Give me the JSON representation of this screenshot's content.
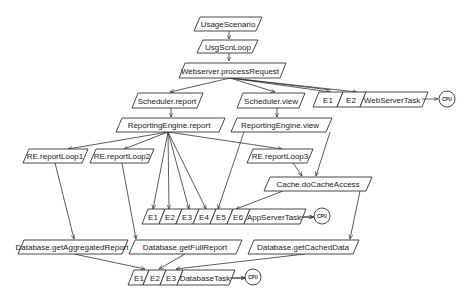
{
  "diagram": {
    "type": "layered-queueing-network",
    "colors": {
      "stroke": "#333333",
      "background": "#ffffff",
      "text": "#222222"
    },
    "nodes": {
      "usage_scenario": "UsageScenario",
      "usg_scn_loop": "UsgScnLoop",
      "webserver_process_request": "Webserver.processRequest",
      "scheduler_report": "Scheduler.report",
      "scheduler_view": "Scheduler.view",
      "reporting_engine_report": "ReportingEngine.report",
      "reporting_engine_view": "ReportingEngine.view",
      "re_report_loop1": "RE.reportLoop1",
      "re_report_loop2": "RE.reportLoop2",
      "re_report_loop3": "RE.reportLoop3",
      "cache_do_cache_access": "Cache.doCacheAccess",
      "database_get_aggregated_report": "Database.getAggregatedReport",
      "database_get_full_report": "Database.getFullReport",
      "database_get_cached_data": "Database.getCachedData"
    },
    "tasks": {
      "webserver": {
        "entries": [
          "E1",
          "E2"
        ],
        "name": "WebServerTask",
        "processor": "CPU"
      },
      "appserver": {
        "entries": [
          "E1",
          "E2",
          "E3",
          "E4",
          "E5",
          "E6"
        ],
        "name": "AppServerTask",
        "processor": "CPU"
      },
      "database": {
        "entries": [
          "E1",
          "E2",
          "E3"
        ],
        "name": "DatabaseTask",
        "processor": "CPU"
      }
    },
    "edges": [
      [
        "UsageScenario",
        "UsgScnLoop"
      ],
      [
        "UsgScnLoop",
        "Webserver.processRequest"
      ],
      [
        "Webserver.processRequest",
        "Scheduler.report"
      ],
      [
        "Webserver.processRequest",
        "Scheduler.view"
      ],
      [
        "Webserver.processRequest",
        "WebServerTask.E1"
      ],
      [
        "Webserver.processRequest",
        "WebServerTask.E2"
      ],
      [
        "Scheduler.report",
        "ReportingEngine.report"
      ],
      [
        "Scheduler.view",
        "ReportingEngine.view"
      ],
      [
        "ReportingEngine.report",
        "RE.reportLoop1"
      ],
      [
        "ReportingEngine.report",
        "RE.reportLoop2"
      ],
      [
        "ReportingEngine.report",
        "RE.reportLoop3"
      ],
      [
        "ReportingEngine.report",
        "AppServerTask.E1"
      ],
      [
        "ReportingEngine.report",
        "AppServerTask.E2"
      ],
      [
        "ReportingEngine.report",
        "AppServerTask.E3"
      ],
      [
        "ReportingEngine.report",
        "AppServerTask.E4"
      ],
      [
        "ReportingEngine.view",
        "AppServerTask.E5"
      ],
      [
        "ReportingEngine.view",
        "Cache.doCacheAccess"
      ],
      [
        "RE.reportLoop3",
        "Cache.doCacheAccess"
      ],
      [
        "Cache.doCacheAccess",
        "AppServerTask.E6"
      ],
      [
        "Cache.doCacheAccess",
        "Database.getCachedData"
      ],
      [
        "RE.reportLoop1",
        "Database.getAggregatedReport"
      ],
      [
        "RE.reportLoop2",
        "Database.getFullReport"
      ],
      [
        "Database.getAggregatedReport",
        "DatabaseTask.E1"
      ],
      [
        "Database.getFullReport",
        "DatabaseTask.E2"
      ],
      [
        "Database.getCachedData",
        "DatabaseTask.E3"
      ],
      [
        "WebServerTask",
        "CPU"
      ],
      [
        "AppServerTask",
        "CPU"
      ],
      [
        "DatabaseTask",
        "CPU"
      ]
    ]
  }
}
